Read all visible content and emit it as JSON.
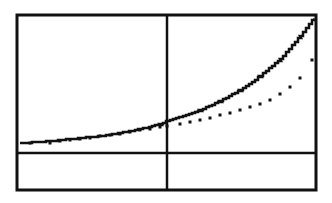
{
  "chart_data": {
    "type": "line",
    "title": "",
    "xlabel": "",
    "ylabel": "",
    "grid": false,
    "legend": null,
    "frame_px": {
      "left": 17,
      "top": 15,
      "right": 316,
      "bottom": 190
    },
    "axes_px": {
      "y_axis_x": 167,
      "x_axis_y": 153
    },
    "xlim": [
      -5,
      5
    ],
    "ylim": [
      -1.2,
      4.6
    ],
    "series": [
      {
        "name": "solid-curve",
        "style": "solid",
        "color": "#111111",
        "points_px": [
          [
            20,
            143
          ],
          [
            40,
            142
          ],
          [
            60,
            140
          ],
          [
            80,
            138
          ],
          [
            100,
            136
          ],
          [
            120,
            133
          ],
          [
            140,
            129
          ],
          [
            160,
            124
          ],
          [
            167,
            121
          ],
          [
            180,
            117
          ],
          [
            200,
            110
          ],
          [
            220,
            101
          ],
          [
            240,
            90
          ],
          [
            260,
            76
          ],
          [
            280,
            59
          ],
          [
            300,
            36
          ],
          [
            313,
            19
          ]
        ]
      },
      {
        "name": "dotted-curve",
        "style": "dotted",
        "color": "#111111",
        "points_px": [
          [
            30,
            143
          ],
          [
            50,
            143
          ],
          [
            60,
            141
          ],
          [
            70,
            140
          ],
          [
            80,
            139
          ],
          [
            90,
            138
          ],
          [
            100,
            136
          ],
          [
            110,
            135
          ],
          [
            120,
            134
          ],
          [
            130,
            132
          ],
          [
            140,
            130
          ],
          [
            150,
            129
          ],
          [
            160,
            127
          ],
          [
            167,
            126
          ],
          [
            180,
            124
          ],
          [
            190,
            122
          ],
          [
            200,
            120
          ],
          [
            210,
            118
          ],
          [
            220,
            115
          ],
          [
            230,
            113
          ],
          [
            240,
            110
          ],
          [
            250,
            107
          ],
          [
            260,
            104
          ],
          [
            270,
            100
          ],
          [
            280,
            94
          ],
          [
            290,
            87
          ],
          [
            300,
            78
          ],
          [
            312,
            60
          ]
        ]
      }
    ]
  },
  "colors": {
    "background": "#ffffff",
    "ink": "#111111"
  }
}
